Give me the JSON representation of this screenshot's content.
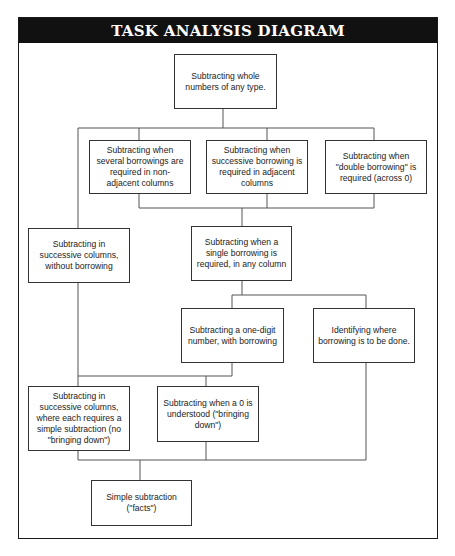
{
  "title": "TASK ANALYSIS DIAGRAM",
  "colors": {
    "title_bar_bg": "#111111",
    "title_text": "#ffffff",
    "box_border": "#333333",
    "line": "#555555"
  },
  "nodes": {
    "root": "Subtracting whole numbers of any type.",
    "several_borrowings": "Subtracting when several borrowings are required in non-adjacent columns",
    "successive_borrowing": "Subtracting when successive borrowing is required in adjacent columns",
    "double_borrowing": "Subtracting when \"double borrowing\" is required (across 0)",
    "successive_no_borrow": "Subtracting in successive columns, without borrowing",
    "single_borrowing": "Subtracting when a single borrowing is required, in any column",
    "one_digit_borrow": "Subtracting a one-digit number, with borrowing",
    "identify_borrow": "Identifying where borrowing is to be done.",
    "successive_simple": "Subtracting in successive columns, where each requires a simple subtraction (no \"bringing down\")",
    "zero_understood": "Subtracting when a 0 is understood (\"bringing down\")",
    "simple_facts": "Simple subtraction (\"facts\")"
  }
}
